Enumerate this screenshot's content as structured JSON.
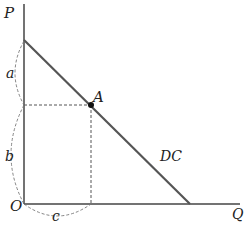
{
  "diagram": {
    "axes": {
      "y_label": "P",
      "x_label": "Q",
      "origin_label": "O"
    },
    "curve": {
      "label": "DC",
      "color": "#555555"
    },
    "point": {
      "label": "A"
    },
    "braces": {
      "a": "a",
      "b": "b",
      "c": "c"
    },
    "colors": {
      "axis": "#444444",
      "dashed": "#555555"
    }
  }
}
